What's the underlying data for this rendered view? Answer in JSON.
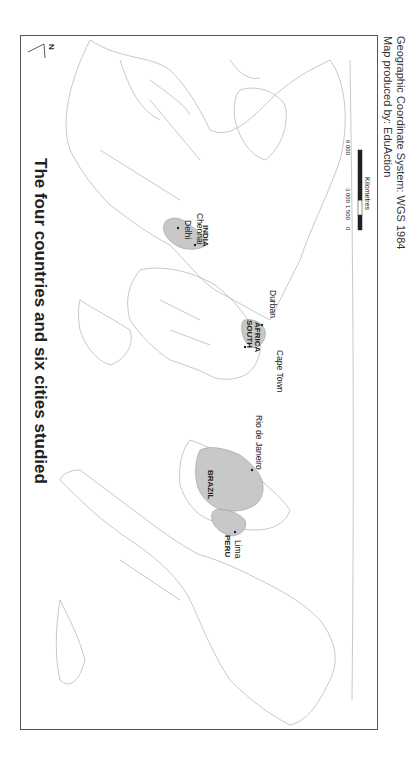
{
  "title": "The four countries and six cities studied",
  "north_arrow": {
    "label": "N"
  },
  "countries": [
    {
      "name": "BRAZIL"
    },
    {
      "name": "PERU"
    },
    {
      "name": "SOUTH AFRICA",
      "line1": "SOUTH",
      "line2": "AFRICA"
    },
    {
      "name": "INDIA"
    }
  ],
  "cities": [
    {
      "name": "Lima"
    },
    {
      "name": "Rio de Janeiro"
    },
    {
      "name": "Cape Town"
    },
    {
      "name": "Durban"
    },
    {
      "name": "Delhi"
    },
    {
      "name": "Chennai"
    }
  ],
  "scale_bar": {
    "ticks": [
      "0",
      "1 500",
      "3 000",
      "6 000"
    ],
    "unit": "Kilometres"
  },
  "credits": {
    "producer": "Map produced by: EduAction",
    "crs": "Geographic Coordinate System: WGS 1984"
  },
  "colors": {
    "highlight_fill": "#c8c8c8",
    "outline": "#aaaaaa",
    "frame": "#555555"
  }
}
